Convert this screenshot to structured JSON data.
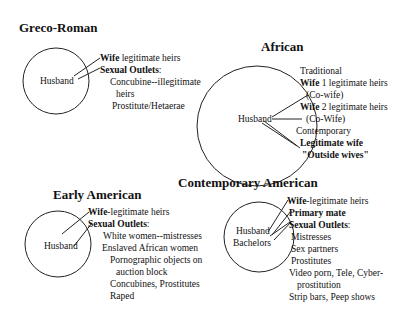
{
  "panels": {
    "greco_roman": {
      "title": "Greco-Roman",
      "center_label": "Husband",
      "lines": [
        {
          "bold": "Wife",
          "text": " legitimate heirs"
        },
        {
          "bold": "Sexual Outlets",
          "text": ":"
        },
        {
          "bold": "",
          "text": "Concubine--illegitimate"
        },
        {
          "bold": "",
          "text": "heirs"
        },
        {
          "bold": "",
          "text": "Prostitute/Hetaerae"
        }
      ]
    },
    "african": {
      "title": "African",
      "center_label": "Husband",
      "lines": [
        {
          "bold": "",
          "text": "Traditional"
        },
        {
          "bold": "Wife",
          "text": " 1 legitimate heirs"
        },
        {
          "bold": "",
          "text": "(Co-wife)"
        },
        {
          "bold": "Wife",
          "text": " 2 legitimate heirs"
        },
        {
          "bold": "",
          "text": "(Co-Wife)"
        },
        {
          "bold": "",
          "text": "Contemporary"
        },
        {
          "bold": "Legitimate wife",
          "text": ""
        },
        {
          "bold": "\"Outside wives\"",
          "text": ""
        }
      ]
    },
    "early_american": {
      "title": "Early American",
      "center_label": "Husband",
      "lines": [
        {
          "bold": "Wife",
          "text": "-legitimate heirs"
        },
        {
          "bold": "Sexual Outlets",
          "text": ":"
        },
        {
          "bold": "",
          "text": "White women--mistresses"
        },
        {
          "bold": "",
          "text": "Enslaved African women"
        },
        {
          "bold": "",
          "text": "Pornographic objects on"
        },
        {
          "bold": "",
          "text": "auction block"
        },
        {
          "bold": "",
          "text": "Concubines, Prostitutes"
        },
        {
          "bold": "",
          "text": "Raped"
        }
      ]
    },
    "contemporary_american": {
      "title": "Contemporary American",
      "center_label_1": "Husband",
      "center_label_2": "Bachelors",
      "lines": [
        {
          "bold": "Wife",
          "text": "-legitimate heirs"
        },
        {
          "bold": "Primary mate",
          "text": ""
        },
        {
          "bold": "Sexual Outlets",
          "text": ":"
        },
        {
          "bold": "",
          "text": "Mistresses"
        },
        {
          "bold": "",
          "text": "Sex partners"
        },
        {
          "bold": "",
          "text": "Prostitutes"
        },
        {
          "bold": "",
          "text": "Video porn, Tele, Cyber-"
        },
        {
          "bold": "",
          "text": "prostitution"
        },
        {
          "bold": "",
          "text": "Strip bars, Peep shows"
        }
      ]
    }
  }
}
